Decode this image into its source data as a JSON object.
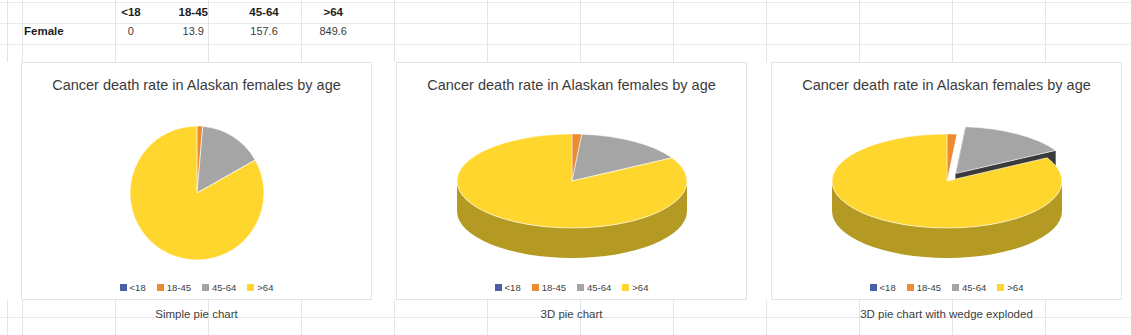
{
  "table": {
    "corner_label": "",
    "column_headers": [
      "<18",
      "18-45",
      "45-64",
      ">64"
    ],
    "rows": [
      {
        "label": "Female",
        "values": [
          "0",
          "13.9",
          "157.6",
          "849.6"
        ]
      }
    ]
  },
  "palette": {
    "under18": "#4A5FA5",
    "age18_45": "#ED8B33",
    "age45_64": "#A5A5A5",
    "over64": "#FFD62E",
    "over64_side": "#B49A22",
    "age45_64_side": "#3A3A3A",
    "age18_45_side": "#A85F1D",
    "panel_border": "#E2E4E8",
    "title_text": "#3B3B3B",
    "grid_line": "#C8CDD4"
  },
  "chart_data": [
    {
      "type": "pie",
      "title": "Cancer death rate in Alaskan females by age",
      "caption": "Simple pie chart",
      "style": "flat",
      "categories": [
        "<18",
        "18-45",
        "45-64",
        ">64"
      ],
      "values": [
        0,
        13.9,
        157.6,
        849.6
      ],
      "percents": [
        0.0,
        1.36,
        15.43,
        83.2
      ],
      "colors": [
        "#4A5FA5",
        "#ED8B33",
        "#A5A5A5",
        "#FFD62E"
      ],
      "legend": [
        "<18",
        "18-45",
        "45-64",
        ">64"
      ],
      "legend_position": "bottom",
      "total": 1021.1,
      "exploded": []
    },
    {
      "type": "pie",
      "title": "Cancer death rate in Alaskan females by age",
      "caption": "3D pie chart",
      "style": "3d",
      "categories": [
        "<18",
        "18-45",
        "45-64",
        ">64"
      ],
      "values": [
        0,
        13.9,
        157.6,
        849.6
      ],
      "percents": [
        0.0,
        1.36,
        15.43,
        83.2
      ],
      "colors": [
        "#4A5FA5",
        "#ED8B33",
        "#A5A5A5",
        "#FFD62E"
      ],
      "legend": [
        "<18",
        "18-45",
        "45-64",
        ">64"
      ],
      "legend_position": "bottom",
      "total": 1021.1,
      "exploded": []
    },
    {
      "type": "pie",
      "title": "Cancer death rate in Alaskan females by age",
      "caption": "3D pie chart with wedge exploded",
      "style": "3d-exploded",
      "categories": [
        "<18",
        "18-45",
        "45-64",
        ">64"
      ],
      "values": [
        0,
        13.9,
        157.6,
        849.6
      ],
      "percents": [
        0.0,
        1.36,
        15.43,
        83.2
      ],
      "colors": [
        "#4A5FA5",
        "#ED8B33",
        "#A5A5A5",
        "#FFD62E"
      ],
      "legend": [
        "<18",
        "18-45",
        "45-64",
        ">64"
      ],
      "legend_position": "bottom",
      "total": 1021.1,
      "exploded": [
        "45-64"
      ]
    }
  ]
}
